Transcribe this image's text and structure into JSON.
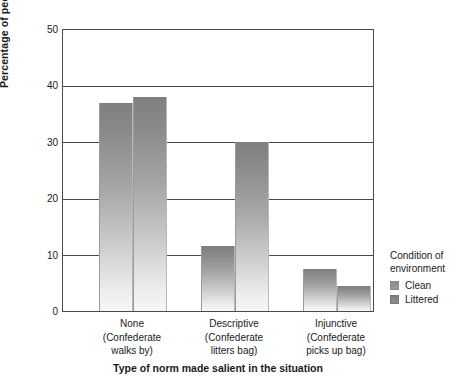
{
  "chart_data": {
    "type": "bar",
    "title": "",
    "xlabel": "Type of norm made salient in the situation",
    "ylabel": "Percentage of people littering",
    "ylim": [
      0,
      50
    ],
    "yticks": [
      0,
      10,
      20,
      30,
      40,
      50
    ],
    "grid": true,
    "legend_position": "right",
    "categories": [
      "None\n(Confederate walks by)",
      "Descriptive\n(Confederate litters bag)",
      "Injunctive\n(Confederate picks up bag)"
    ],
    "category_labels": [
      {
        "name": "None",
        "sub_line1": "(Confederate",
        "sub_line2": "walks by)"
      },
      {
        "name": "Descriptive",
        "sub_line1": "(Confederate",
        "sub_line2": "litters bag)"
      },
      {
        "name": "Injunctive",
        "sub_line1": "(Confederate",
        "sub_line2": "picks up bag)"
      }
    ],
    "series": [
      {
        "name": "Clean",
        "values": [
          37.0,
          11.5,
          7.5
        ]
      },
      {
        "name": "Littered",
        "values": [
          38.0,
          30.0,
          4.5
        ]
      }
    ],
    "colors": {
      "bar_top": "#7f7f7f",
      "bar_bottom": "#f6f6f6",
      "axis": "#4a4a4a",
      "text": "#1a1a1a",
      "background": "#ffffff"
    }
  },
  "legend": {
    "title_line1": "Condition of",
    "title_line2": "environment",
    "items": [
      {
        "label": "Clean"
      },
      {
        "label": "Littered"
      }
    ]
  },
  "axis": {
    "y_tick_labels": [
      "0",
      "10",
      "20",
      "30",
      "40",
      "50"
    ],
    "y_title": "Percentage of people littering",
    "x_title": "Type of norm made salient in the situation"
  }
}
